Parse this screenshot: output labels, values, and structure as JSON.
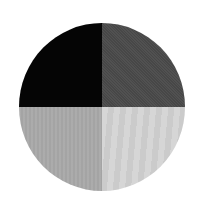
{
  "figure": {
    "shape": "circle",
    "quadrants": [
      {
        "position": "top-left",
        "color": "#050505",
        "label": ""
      },
      {
        "position": "top-right",
        "color": "#4a4a4a",
        "label": ""
      },
      {
        "position": "bottom-left",
        "color": "#a9a9a9",
        "label": ""
      },
      {
        "position": "bottom-right",
        "color": "#d3d3d3",
        "label": ""
      }
    ],
    "background": "#ffffff"
  }
}
